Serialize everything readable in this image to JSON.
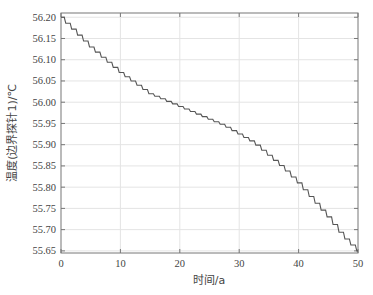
{
  "chart_data": {
    "type": "line",
    "title": "",
    "xlabel": "时间/a",
    "ylabel": "温度(边界探针1)/℃",
    "xlim": [
      0,
      50
    ],
    "ylim": [
      55.645,
      56.21
    ],
    "grid": true,
    "legend": null,
    "x_ticks": [
      0,
      10,
      20,
      30,
      40,
      50
    ],
    "x_tick_labels": [
      "0",
      "10",
      "20",
      "30",
      "40",
      "50"
    ],
    "y_ticks": [
      55.65,
      55.7,
      55.75,
      55.8,
      55.85,
      55.9,
      55.95,
      56.0,
      56.05,
      56.1,
      56.15,
      56.2
    ],
    "y_tick_labels": [
      "55.65",
      "55.70",
      "55.75",
      "55.80",
      "55.85",
      "55.90",
      "55.95",
      "56.00",
      "56.05",
      "56.10",
      "56.15",
      "56.20"
    ],
    "series": [
      {
        "name": "边界探针1",
        "color": "#555555",
        "style": "stepped",
        "x": [
          0,
          2.5,
          5,
          7.5,
          10,
          12.5,
          15,
          17.5,
          20,
          22.5,
          25,
          27.5,
          30,
          32.5,
          35,
          37.5,
          40,
          42.5,
          45,
          47.5,
          50
        ],
        "values": [
          56.2,
          56.165,
          56.13,
          56.1,
          56.07,
          56.045,
          56.02,
          56.005,
          55.99,
          55.975,
          55.96,
          55.945,
          55.925,
          55.905,
          55.875,
          55.845,
          55.81,
          55.77,
          55.73,
          55.685,
          55.65
        ]
      }
    ]
  }
}
